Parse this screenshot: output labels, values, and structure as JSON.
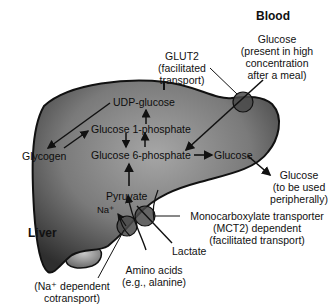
{
  "regions": {
    "blood": "Blood",
    "liver": "Liver"
  },
  "metabolites": {
    "udp_glucose": "UDP-glucose",
    "glucose_1_phosphate": "Glucose 1-phosphate",
    "glucose_6_phosphate": "Glucose 6-phosphate",
    "glycogen": "Glycogen",
    "glucose_internal": "Glucose",
    "pyruvate": "Pyruvate",
    "na_plus": "Na⁺"
  },
  "external": {
    "glucose_blood": [
      "Glucose",
      "(present in high",
      "concentration",
      "after a meal)"
    ],
    "glucose_out": [
      "Glucose",
      "(to be used",
      "peripherally)"
    ],
    "lactate": "Lactate",
    "amino_acids": [
      "Amino acids",
      "(e.g., alanine)"
    ]
  },
  "transporters": {
    "glut2": [
      "GLUT2",
      "(facilitated",
      "transport)"
    ],
    "mct2": [
      "Monocarboxylate transporter",
      "(MCT2) dependent",
      "(facilitated transport)"
    ],
    "na_cotransport": [
      "(Na⁺ dependent",
      "cotransport)"
    ]
  },
  "colors": {
    "liver_light": "#9a9a9a",
    "liver_dark": "#3a3a3a",
    "outline": "#111111",
    "transporter": "#555555"
  }
}
